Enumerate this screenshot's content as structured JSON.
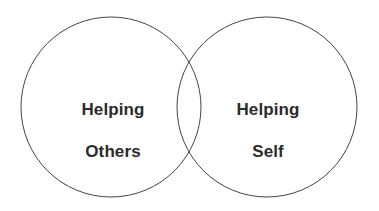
{
  "canvas": {
    "width": 379,
    "height": 211,
    "background_color": "#ffffff"
  },
  "diagram": {
    "type": "venn",
    "set_count": 2,
    "stroke_color": "#444444",
    "stroke_width": 1,
    "fill": "none",
    "text_color": "#2b2b2b",
    "circles": [
      {
        "id": "left",
        "cx": 111,
        "cy": 107,
        "r": 90
      },
      {
        "id": "right",
        "cx": 267,
        "cy": 107,
        "r": 90
      }
    ],
    "labels": {
      "left": {
        "full": "Helping Others",
        "line1": "Helping",
        "line2": "Others"
      },
      "right": {
        "full": "Helping Self",
        "line1": "Helping",
        "line2": "Self"
      },
      "overlap": ""
    }
  }
}
